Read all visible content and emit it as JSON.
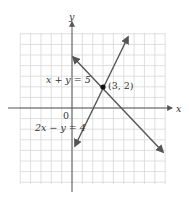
{
  "chart_data": {
    "type": "line",
    "title": "",
    "xlabel": "x",
    "ylabel": "y",
    "xlim": [
      -5,
      9
    ],
    "ylim": [
      -7,
      7
    ],
    "grid": true,
    "series": [
      {
        "name": "x + y = 5",
        "equation": "x + y = 5",
        "points": [
          [
            0,
            5
          ],
          [
            8,
            -3
          ]
        ]
      },
      {
        "name": "2x − y = 4",
        "equation": "2x − y = 4",
        "points": [
          [
            0,
            -4
          ],
          [
            5,
            6
          ]
        ]
      }
    ],
    "annotations": [
      {
        "text": "(3, 2)",
        "x": 3,
        "y": 2,
        "type": "intersection-point"
      },
      {
        "text": "0",
        "x": 0,
        "y": 0,
        "type": "origin-label"
      }
    ],
    "colors": {
      "lines": "#555555",
      "grid": "#d8d8d8",
      "axes": "#555555"
    }
  },
  "labels": {
    "x_axis": "x",
    "y_axis": "y",
    "origin": "0",
    "line1": "x + y = 5",
    "line2": "2x − y = 4",
    "point": "(3, 2)"
  }
}
